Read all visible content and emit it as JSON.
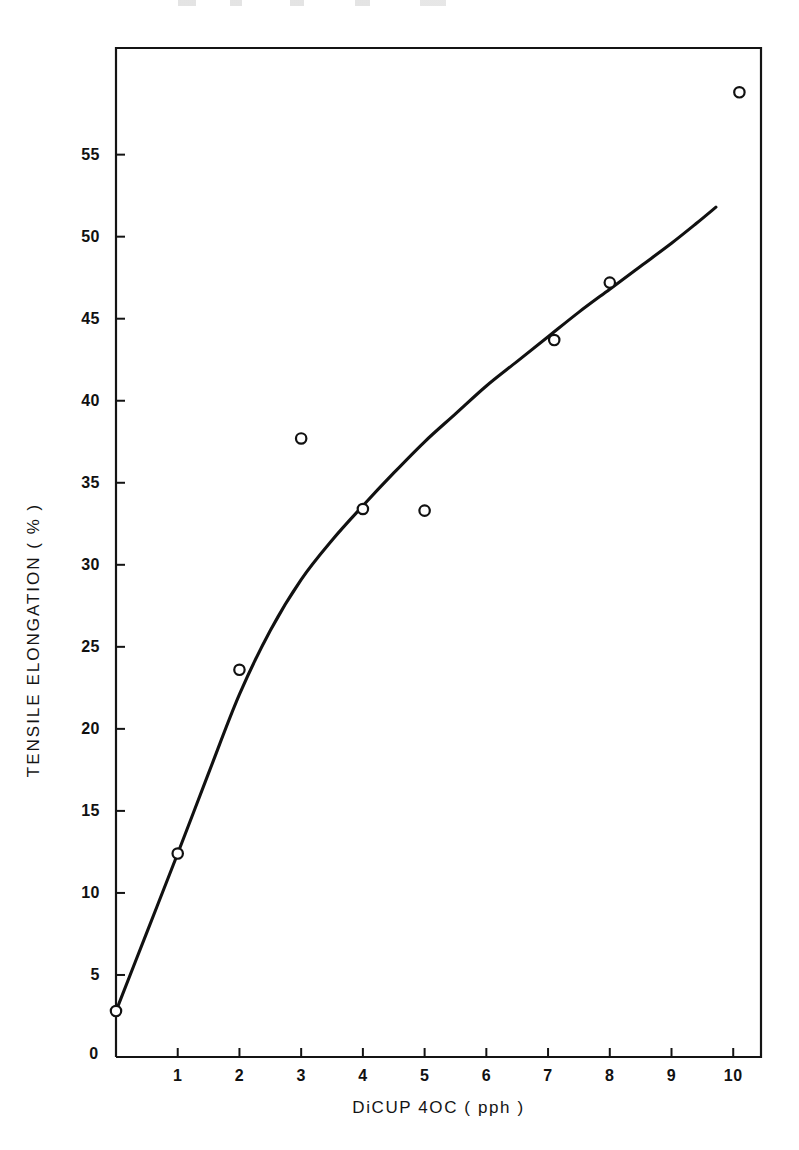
{
  "chart_data": {
    "type": "scatter",
    "title": "",
    "subtitle": "",
    "xlabel": "DiCUP 4OC  ( pph )",
    "ylabel": "TENSILE  ELONGATION  ( % )",
    "xlim": [
      0,
      10.45
    ],
    "ylim": [
      0,
      61.5
    ],
    "grid": false,
    "legend": null,
    "xticks": [
      {
        "value": 0,
        "label": "0"
      },
      {
        "value": 1,
        "label": "1"
      },
      {
        "value": 2,
        "label": "2"
      },
      {
        "value": 3,
        "label": "3"
      },
      {
        "value": 4,
        "label": "4"
      },
      {
        "value": 5,
        "label": "5"
      },
      {
        "value": 6,
        "label": "6"
      },
      {
        "value": 7,
        "label": "7"
      },
      {
        "value": 8,
        "label": "8"
      },
      {
        "value": 9,
        "label": "9"
      },
      {
        "value": 10,
        "label": "10"
      }
    ],
    "yticks": [
      {
        "value": 5,
        "label": "5"
      },
      {
        "value": 10,
        "label": "10"
      },
      {
        "value": 15,
        "label": "15"
      },
      {
        "value": 20,
        "label": "20"
      },
      {
        "value": 25,
        "label": "25"
      },
      {
        "value": 30,
        "label": "30"
      },
      {
        "value": 35,
        "label": "35"
      },
      {
        "value": 40,
        "label": "40"
      },
      {
        "value": 45,
        "label": "45"
      },
      {
        "value": 50,
        "label": "50"
      },
      {
        "value": 55,
        "label": "55"
      }
    ],
    "series": [
      {
        "name": "measured",
        "type": "scatter",
        "marker": "open-circle",
        "color": "#111111",
        "points": [
          {
            "x": 0.0,
            "y": 2.8
          },
          {
            "x": 1.0,
            "y": 12.4
          },
          {
            "x": 2.0,
            "y": 23.6
          },
          {
            "x": 3.0,
            "y": 37.7
          },
          {
            "x": 4.0,
            "y": 33.4
          },
          {
            "x": 5.0,
            "y": 33.3
          },
          {
            "x": 7.1,
            "y": 43.7
          },
          {
            "x": 8.0,
            "y": 47.2
          },
          {
            "x": 10.1,
            "y": 58.8
          }
        ]
      },
      {
        "name": "fitted-curve",
        "type": "line",
        "color": "#111111",
        "points": [
          {
            "x": 0.0,
            "y": 2.8
          },
          {
            "x": 0.5,
            "y": 7.6
          },
          {
            "x": 1.0,
            "y": 12.4
          },
          {
            "x": 1.5,
            "y": 17.3
          },
          {
            "x": 2.0,
            "y": 22.1
          },
          {
            "x": 2.5,
            "y": 26.0
          },
          {
            "x": 3.0,
            "y": 29.1
          },
          {
            "x": 3.5,
            "y": 31.5
          },
          {
            "x": 4.0,
            "y": 33.6
          },
          {
            "x": 4.5,
            "y": 35.6
          },
          {
            "x": 5.0,
            "y": 37.5
          },
          {
            "x": 5.5,
            "y": 39.2
          },
          {
            "x": 6.0,
            "y": 40.9
          },
          {
            "x": 6.5,
            "y": 42.4
          },
          {
            "x": 7.0,
            "y": 43.9
          },
          {
            "x": 7.5,
            "y": 45.4
          },
          {
            "x": 8.0,
            "y": 46.8
          },
          {
            "x": 8.5,
            "y": 48.2
          },
          {
            "x": 9.0,
            "y": 49.6
          },
          {
            "x": 9.4,
            "y": 50.8
          },
          {
            "x": 9.72,
            "y": 51.8
          }
        ]
      }
    ]
  }
}
